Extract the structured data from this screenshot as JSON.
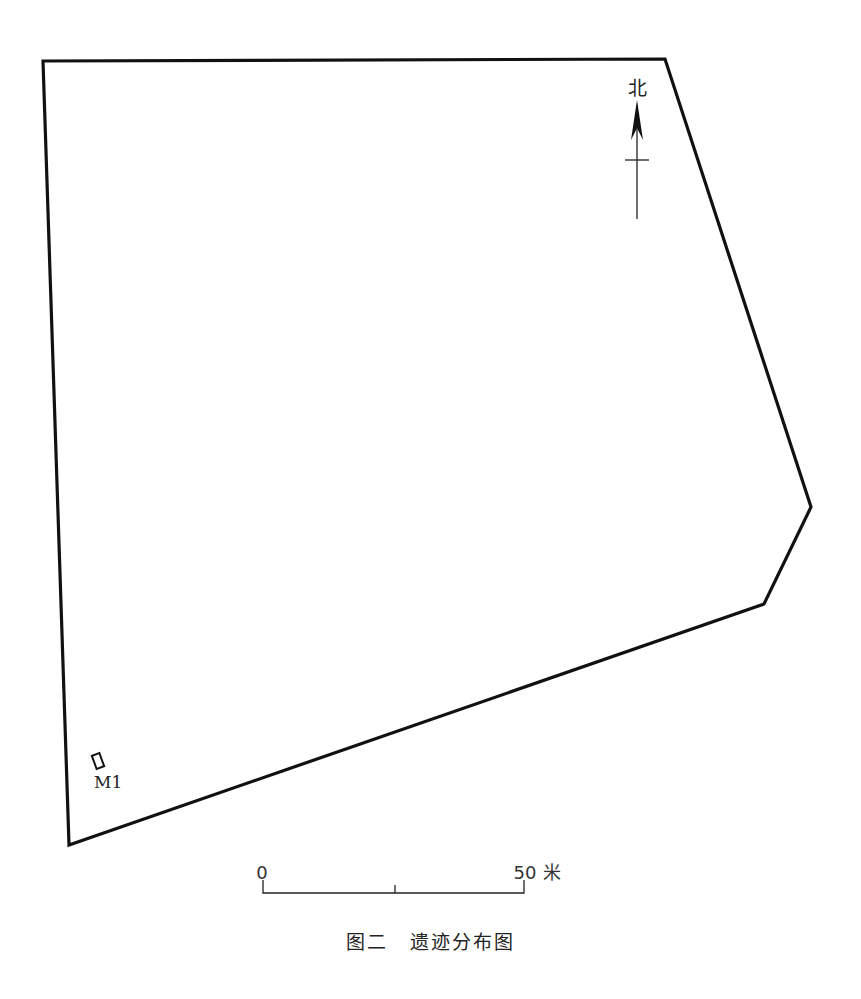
{
  "figure": {
    "number_label": "图二",
    "title": "遗迹分布图"
  },
  "north_arrow": {
    "label": "北",
    "icon": "north-arrow-icon"
  },
  "features": [
    {
      "id": "M1",
      "label": "M1",
      "type": "tomb"
    }
  ],
  "scale_bar": {
    "start_label": "0",
    "end_label": "50",
    "unit": "米",
    "length_value": 50
  },
  "colors": {
    "line": "#111111",
    "background": "#ffffff"
  }
}
